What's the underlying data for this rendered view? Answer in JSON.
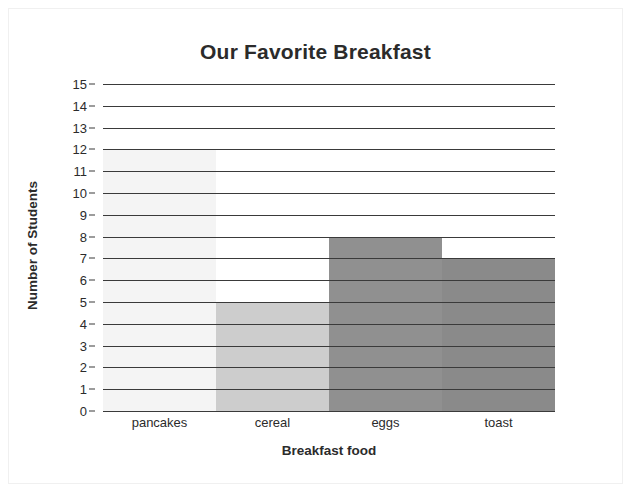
{
  "chart_data": {
    "type": "bar",
    "title": "Our Favorite Breakfast",
    "xlabel": "Breakfast food",
    "ylabel": "Number of Students",
    "categories": [
      "pancakes",
      "cereal",
      "eggs",
      "toast"
    ],
    "values": [
      12,
      5,
      8,
      7
    ],
    "ylim": [
      0,
      15
    ],
    "ytick_labels": [
      "15",
      "14",
      "13",
      "12",
      "11",
      "10",
      "9",
      "8",
      "7",
      "6",
      "5",
      "4",
      "3",
      "2",
      "1",
      "0"
    ],
    "ytick_values": [
      15,
      14,
      13,
      12,
      11,
      10,
      9,
      8,
      7,
      6,
      5,
      4,
      3,
      2,
      1,
      0
    ],
    "grid": true,
    "legend": false,
    "bar_colors": [
      "#f4f4f4",
      "#cdcdcd",
      "#909090",
      "#8a8a8a"
    ],
    "gridline_color": "#3a3a3a",
    "text_color": "#2b2b2b",
    "background": "#ffffff"
  }
}
